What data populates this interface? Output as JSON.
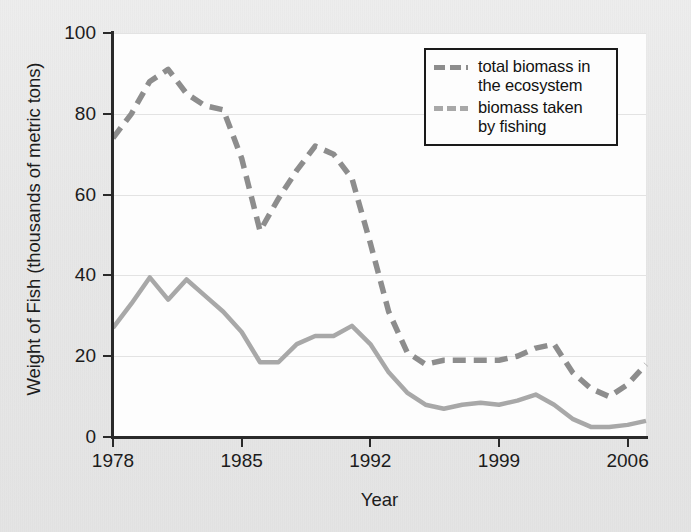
{
  "chart_data": {
    "type": "line",
    "title": "",
    "xlabel": "Year",
    "ylabel": "Weight of Fish (thousands of metric tons)",
    "xlim": [
      1978,
      2007
    ],
    "ylim": [
      0,
      100
    ],
    "xticks": [
      1978,
      1985,
      1992,
      1999,
      2006
    ],
    "yticks": [
      0,
      20,
      40,
      60,
      80,
      100
    ],
    "grid": "horizontal",
    "legend_position": "top-right",
    "x": [
      1978,
      1979,
      1980,
      1981,
      1982,
      1983,
      1984,
      1985,
      1986,
      1987,
      1988,
      1989,
      1990,
      1991,
      1992,
      1993,
      1994,
      1995,
      1996,
      1997,
      1998,
      1999,
      2000,
      2001,
      2002,
      2003,
      2004,
      2005,
      2006,
      2007
    ],
    "series": [
      {
        "name": "total biomass in the ecosystem",
        "style": "dashed",
        "color": "#8d8d8d",
        "values": [
          74,
          80,
          88,
          91,
          85,
          82,
          81,
          69,
          51,
          59,
          66,
          72,
          70,
          64,
          48,
          31,
          21,
          18,
          19,
          19,
          19,
          19,
          20,
          22,
          23,
          16,
          12,
          10,
          13,
          18
        ]
      },
      {
        "name": "biomass taken by fishing",
        "style": "solid",
        "color": "#a8a8a8",
        "values": [
          27,
          33,
          39.5,
          34,
          39,
          35,
          31,
          26,
          18.5,
          18.5,
          23,
          25,
          25,
          27.5,
          23,
          16,
          11,
          8,
          7,
          8,
          8.5,
          8,
          9,
          10.5,
          8,
          4.5,
          2.5,
          2.5,
          3,
          4
        ]
      }
    ]
  },
  "axes": {
    "y_title": "Weight of Fish (thousands of metric tons)",
    "x_title": "Year",
    "y_tick_labels": [
      "100",
      "80",
      "60",
      "40",
      "20",
      "0"
    ],
    "x_tick_labels": [
      "1978",
      "1985",
      "1992",
      "1999",
      "2006"
    ]
  },
  "legend": {
    "entries": [
      {
        "label": "total biomass in\nthe ecosystem",
        "style": "dashed"
      },
      {
        "label": "biomass taken\nby fishing",
        "style": "solid"
      }
    ]
  }
}
